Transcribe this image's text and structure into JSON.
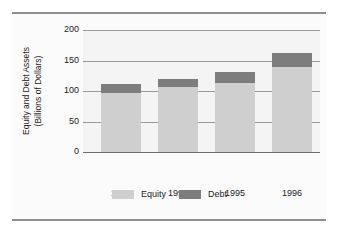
{
  "chart_data": {
    "type": "bar",
    "stacked": true,
    "title": "",
    "xlabel": "",
    "ylabel": "Equity and Debt Assets (Billions of Dollars)",
    "ylabel_lines": [
      "Equity and Debt Assets",
      "(Billions of Dollars)"
    ],
    "categories": [
      "1993",
      "1994",
      "1995",
      "1996"
    ],
    "series": [
      {
        "name": "Equity",
        "values": [
          97,
          106,
          113,
          139
        ],
        "color": "#cfcfcf"
      },
      {
        "name": "Debt",
        "values": [
          15,
          14,
          18,
          24
        ],
        "color": "#7d7d7d"
      }
    ],
    "totals": [
      112,
      120,
      131,
      163
    ],
    "ylim": [
      0,
      200
    ],
    "yticks": [
      0,
      50,
      100,
      150,
      200
    ],
    "ytick_labels": [
      "0",
      "50",
      "100",
      "150",
      "200"
    ],
    "grid": true,
    "legend_position": "bottom"
  },
  "legend": {
    "items": [
      {
        "label": "Equity",
        "color": "#cfcfcf"
      },
      {
        "label": "Debt",
        "color": "#7d7d7d"
      }
    ]
  },
  "colors": {
    "equity": "#cfcfcf",
    "debt": "#7d7d7d",
    "panel": "#fbfbfb",
    "plot_background": "#f4f4f4",
    "gridline": "#9a9a9a",
    "rule": "#8e8e8e",
    "text": "#1b1b1b"
  }
}
